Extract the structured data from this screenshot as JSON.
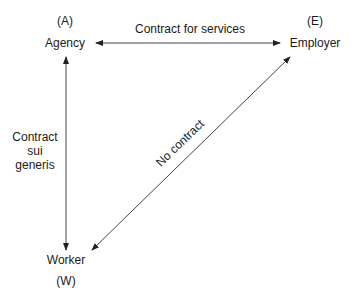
{
  "nodes": {
    "agency": {
      "code": "(A)",
      "label": "Agency"
    },
    "employer": {
      "code": "(E)",
      "label": "Employer"
    },
    "worker": {
      "label": "Worker",
      "code": "(W)"
    }
  },
  "edges": {
    "agency_employer": "Contract for services",
    "agency_worker": [
      "Contract",
      "sui",
      "generis"
    ],
    "employer_worker": "No contract"
  }
}
